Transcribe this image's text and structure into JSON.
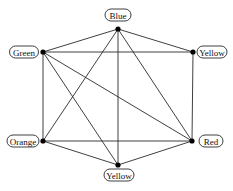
{
  "diagram": {
    "type": "graph",
    "nodes": [
      {
        "id": "blue",
        "label": "Blue",
        "x": 118,
        "y": 29,
        "label_x": 118,
        "label_y": 15,
        "label_w": 26
      },
      {
        "id": "yellow_right",
        "label": "Yellow",
        "x": 193,
        "y": 52,
        "label_x": 212,
        "label_y": 52,
        "label_w": 30
      },
      {
        "id": "red",
        "label": "Red",
        "x": 192,
        "y": 141,
        "label_x": 211,
        "label_y": 141,
        "label_w": 24
      },
      {
        "id": "yellow_bottom",
        "label": "Yellow",
        "x": 118,
        "y": 165,
        "label_x": 119,
        "label_y": 175,
        "label_w": 30
      },
      {
        "id": "orange",
        "label": "Orange",
        "x": 43,
        "y": 141,
        "label_x": 23,
        "label_y": 141,
        "label_w": 32
      },
      {
        "id": "green",
        "label": "Green",
        "x": 43,
        "y": 52,
        "label_x": 24,
        "label_y": 52,
        "label_w": 29
      }
    ],
    "edges": [
      [
        "blue",
        "green"
      ],
      [
        "blue",
        "yellow_right"
      ],
      [
        "blue",
        "orange"
      ],
      [
        "blue",
        "yellow_bottom"
      ],
      [
        "blue",
        "red"
      ],
      [
        "green",
        "yellow_right"
      ],
      [
        "green",
        "orange"
      ],
      [
        "green",
        "red"
      ],
      [
        "green",
        "yellow_bottom"
      ],
      [
        "yellow_right",
        "red"
      ],
      [
        "orange",
        "red"
      ],
      [
        "orange",
        "yellow_bottom"
      ],
      [
        "red",
        "yellow_bottom"
      ]
    ],
    "colors": {
      "edge": "#2a2a2a",
      "node": "#000000",
      "label_border": "#2a2a2a",
      "label_text": "#111111",
      "background": "#ffffff"
    }
  }
}
